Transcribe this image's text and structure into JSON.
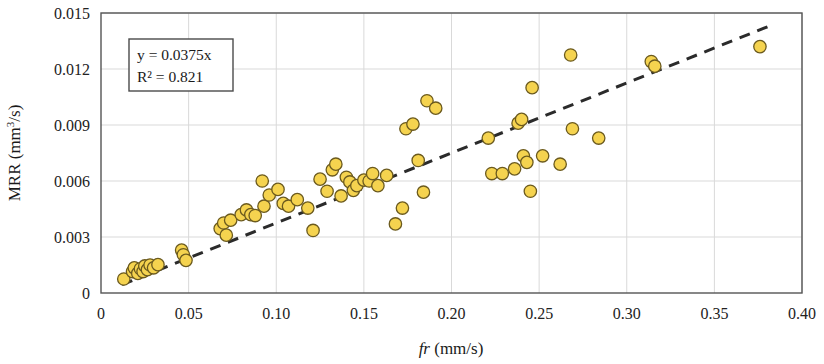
{
  "chart_data": {
    "type": "scatter",
    "title": "",
    "xlabel": "fr (mm/s)",
    "xlabel_italic_part": "fr",
    "xlabel_rest": " (mm/s)",
    "ylabel": "MRR (mm3/s)",
    "ylabel_main": "MRR (mm",
    "ylabel_sup": "3",
    "ylabel_tail": "/s)",
    "xlim": [
      0,
      0.4
    ],
    "ylim": [
      0,
      0.015
    ],
    "xticks": [
      0,
      0.05,
      0.1,
      0.15,
      0.2,
      0.25,
      0.3,
      0.35,
      0.4
    ],
    "xtick_labels": [
      "0",
      "0.05",
      "0.10",
      "0.15",
      "0.20",
      "0.25",
      "0.30",
      "0.35",
      "0.40"
    ],
    "yticks": [
      0,
      0.003,
      0.006,
      0.009,
      0.012,
      0.015
    ],
    "ytick_labels": [
      "0",
      "0.003",
      "0.006",
      "0.009",
      "0.012",
      "0.015"
    ],
    "grid": true,
    "grid_color": "#d9d9d9",
    "legend": "none",
    "marker": {
      "shape": "circle",
      "fill": "#f5d34f",
      "edge": "#6b5a1e",
      "radius": 6.2,
      "edge_width": 1.3
    },
    "trendline": {
      "type": "linear-through-origin",
      "equation": "y = 0.0375x",
      "r_squared": "R² = 0.821",
      "slope": 0.0375,
      "intercept": 0,
      "style": "dashed",
      "color": "#2b2b2b",
      "width": 3,
      "x_start": 0.012,
      "x_end": 0.383
    },
    "annotation_box": {
      "line1": "y = 0.0375x",
      "line2": "R² = 0.821",
      "border_color": "#4a4a4a",
      "background": "#ffffff"
    },
    "points": [
      [
        0.013,
        0.00075
      ],
      [
        0.018,
        0.00115
      ],
      [
        0.019,
        0.00135
      ],
      [
        0.021,
        0.00105
      ],
      [
        0.0225,
        0.0013
      ],
      [
        0.024,
        0.00115
      ],
      [
        0.025,
        0.00145
      ],
      [
        0.0265,
        0.00125
      ],
      [
        0.028,
        0.0015
      ],
      [
        0.03,
        0.00135
      ],
      [
        0.0325,
        0.00152
      ],
      [
        0.046,
        0.0023
      ],
      [
        0.047,
        0.00205
      ],
      [
        0.0485,
        0.00175
      ],
      [
        0.068,
        0.00345
      ],
      [
        0.07,
        0.00375
      ],
      [
        0.0715,
        0.0031
      ],
      [
        0.074,
        0.0039
      ],
      [
        0.08,
        0.0042
      ],
      [
        0.083,
        0.00445
      ],
      [
        0.0855,
        0.0042
      ],
      [
        0.088,
        0.00415
      ],
      [
        0.092,
        0.006
      ],
      [
        0.093,
        0.00465
      ],
      [
        0.096,
        0.00525
      ],
      [
        0.101,
        0.00555
      ],
      [
        0.104,
        0.0048
      ],
      [
        0.107,
        0.00465
      ],
      [
        0.112,
        0.005
      ],
      [
        0.118,
        0.00455
      ],
      [
        0.121,
        0.00335
      ],
      [
        0.125,
        0.0061
      ],
      [
        0.129,
        0.00545
      ],
      [
        0.132,
        0.0066
      ],
      [
        0.134,
        0.0069
      ],
      [
        0.137,
        0.0052
      ],
      [
        0.14,
        0.0062
      ],
      [
        0.142,
        0.00595
      ],
      [
        0.144,
        0.0055
      ],
      [
        0.146,
        0.00575
      ],
      [
        0.15,
        0.00605
      ],
      [
        0.153,
        0.006
      ],
      [
        0.155,
        0.0064
      ],
      [
        0.158,
        0.00575
      ],
      [
        0.163,
        0.0063
      ],
      [
        0.168,
        0.0037
      ],
      [
        0.172,
        0.00455
      ],
      [
        0.174,
        0.0088
      ],
      [
        0.178,
        0.00905
      ],
      [
        0.181,
        0.0071
      ],
      [
        0.184,
        0.0054
      ],
      [
        0.186,
        0.0103
      ],
      [
        0.191,
        0.0099
      ],
      [
        0.221,
        0.0083
      ],
      [
        0.223,
        0.0064
      ],
      [
        0.229,
        0.0064
      ],
      [
        0.236,
        0.00665
      ],
      [
        0.238,
        0.0091
      ],
      [
        0.24,
        0.0093
      ],
      [
        0.241,
        0.00735
      ],
      [
        0.243,
        0.007
      ],
      [
        0.245,
        0.00545
      ],
      [
        0.246,
        0.011
      ],
      [
        0.252,
        0.00735
      ],
      [
        0.262,
        0.0069
      ],
      [
        0.268,
        0.01275
      ],
      [
        0.269,
        0.0088
      ],
      [
        0.284,
        0.0083
      ],
      [
        0.314,
        0.0124
      ],
      [
        0.316,
        0.01215
      ],
      [
        0.376,
        0.0132
      ]
    ]
  },
  "figure": {
    "plot_area": {
      "left": 101,
      "right": 802,
      "top": 13,
      "bottom": 293
    },
    "frame_color": "#555555"
  }
}
